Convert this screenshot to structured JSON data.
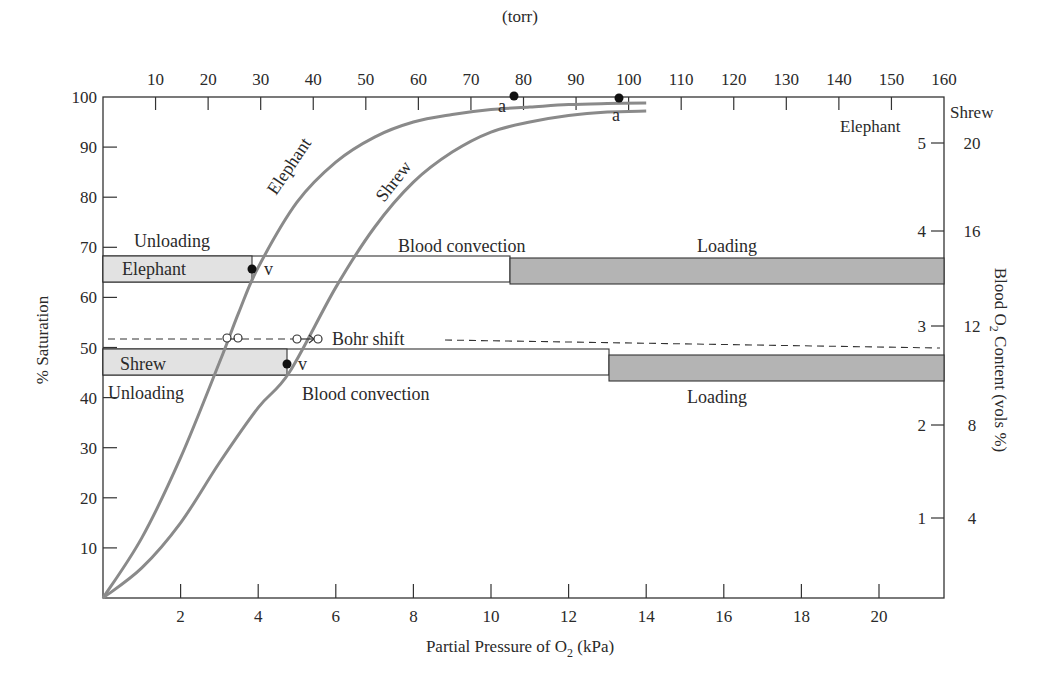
{
  "chart_data": {
    "type": "line",
    "title": "",
    "xlabel": "Partial Pressure of O2 (kPa)",
    "xlabel_main": "Partial Pressure of O",
    "xlabel_sub": "2",
    "xlabel_tail": " (kPa)",
    "x2label": "(torr)",
    "ylabel": "% Saturation",
    "y2label": "Blood O2 Content (vols %)",
    "y2label_main": "Blood O",
    "y2label_sub": "2",
    "y2label_tail": " Content (vols %)",
    "xlim": [
      0,
      21.5
    ],
    "ylim": [
      0,
      100
    ],
    "x_ticks": [
      2,
      4,
      6,
      8,
      10,
      12,
      14,
      16,
      18,
      20
    ],
    "x2_ticks_torr": [
      10,
      20,
      30,
      40,
      50,
      60,
      70,
      80,
      90,
      100,
      110,
      120,
      130,
      140,
      150,
      160
    ],
    "y_ticks": [
      10,
      20,
      30,
      40,
      50,
      60,
      70,
      80,
      90,
      100
    ],
    "y2_scale_elephant": {
      "label": "Elephant",
      "ticks": [
        1,
        2,
        3,
        4,
        5
      ]
    },
    "y2_scale_shrew": {
      "label": "Shrew",
      "ticks": [
        4,
        8,
        12,
        16,
        20
      ]
    },
    "grid": false,
    "series": [
      {
        "name": "Elephant",
        "x": [
          0,
          1,
          2,
          3,
          3.5,
          4,
          5,
          6,
          7,
          8,
          9,
          10,
          11,
          12,
          13,
          14
        ],
        "values": [
          0,
          12,
          28,
          47,
          57,
          66,
          79,
          87,
          92,
          95,
          96.5,
          97.5,
          98,
          98.5,
          98.7,
          98.8
        ],
        "arterial_point": {
          "x": 10.4,
          "y": 98,
          "label": "a"
        },
        "venous_point": {
          "x": 3.9,
          "y": 64,
          "label": "v"
        },
        "p50_kPa": 3.2
      },
      {
        "name": "Shrew",
        "x": [
          0,
          1,
          2,
          3,
          4,
          4.8,
          6,
          7,
          8,
          9,
          10,
          11,
          12,
          13,
          14
        ],
        "values": [
          0,
          6,
          15,
          27,
          38,
          45,
          62,
          74,
          83,
          89,
          93,
          95,
          96.3,
          97,
          97.2
        ],
        "arterial_point": {
          "x": 13.6,
          "y": 97,
          "label": "a"
        },
        "venous_point": {
          "x": 4.8,
          "y": 45,
          "label": "v"
        },
        "p50_kPa": 5.1
      }
    ],
    "bars": [
      {
        "animal": "Elephant",
        "y_range": [
          61,
          67
        ],
        "unloading_end_kPa": 3.9,
        "loading_start_kPa": 10.8
      },
      {
        "animal": "Shrew",
        "y_range": [
          43,
          48
        ],
        "unloading_end_kPa": 4.8,
        "loading_start_kPa": 13.4
      }
    ],
    "annotations": [
      "Unloading",
      "Blood convection",
      "Loading",
      "Bohr shift",
      "Elephant",
      "Shrew",
      "a",
      "v"
    ]
  },
  "labels": {
    "unloading": "Unloading",
    "blood_convection": "Blood convection",
    "loading": "Loading",
    "bohr_shift": "Bohr shift",
    "elephant": "Elephant",
    "shrew": "Shrew",
    "arterial": "a",
    "venous": "v"
  }
}
